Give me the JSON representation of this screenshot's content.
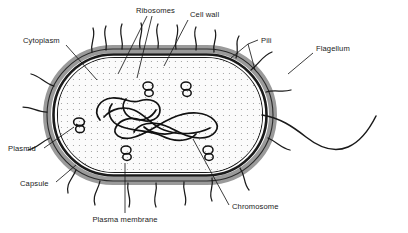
{
  "figure": {
    "type": "labelled-biological-diagram",
    "background_color": "#ffffff",
    "ink_color": "#1a1a1a",
    "capsule_color": "#9a9a9a",
    "cytoplasm_color": "#fbfbfb",
    "cytoplasm_stipple_color": "#7a7a7a"
  },
  "labels": {
    "ribosomes": "Ribosomes",
    "cell_wall": "Cell wall",
    "cytoplasm": "Cytoplasm",
    "pili": "Pili",
    "flagellum": "Flagellum",
    "plasmid": "Plasmid",
    "capsule": "Capsule",
    "plasma_membrane": "Plasma membrane",
    "chromosome": "Chromosome"
  },
  "structures": [
    {
      "name": "capsule",
      "label": "Capsule",
      "description": "Outer grey slime layer surrounding the cell wall"
    },
    {
      "name": "cell-wall",
      "label": "Cell wall",
      "description": "Rigid dark boundary layer inside the capsule"
    },
    {
      "name": "plasma-membrane",
      "label": "Plasma membrane",
      "description": "Thin membrane lining the inside of the cell wall"
    },
    {
      "name": "cytoplasm",
      "label": "Cytoplasm",
      "description": "Stippled interior fluid of the cell"
    },
    {
      "name": "chromosome",
      "label": "Chromosome",
      "description": "Single large tangled circular DNA loop (nucleoid)"
    },
    {
      "name": "plasmid",
      "label": "Plasmid",
      "description": "Small circular DNA rings scattered in cytoplasm"
    },
    {
      "name": "ribosomes",
      "label": "Ribosomes",
      "description": "Small figure-eight granules throughout the cytoplasm"
    },
    {
      "name": "pili",
      "label": "Pili",
      "description": "Short hair-like projections around the cell surface"
    },
    {
      "name": "flagellum",
      "label": "Flagellum",
      "description": "Long wavy tail extending from the right pole"
    }
  ],
  "counts": {
    "ribosomes_drawn": 6,
    "plasmids_drawn": 1,
    "pili_drawn": 18,
    "flagella_drawn": 1
  }
}
